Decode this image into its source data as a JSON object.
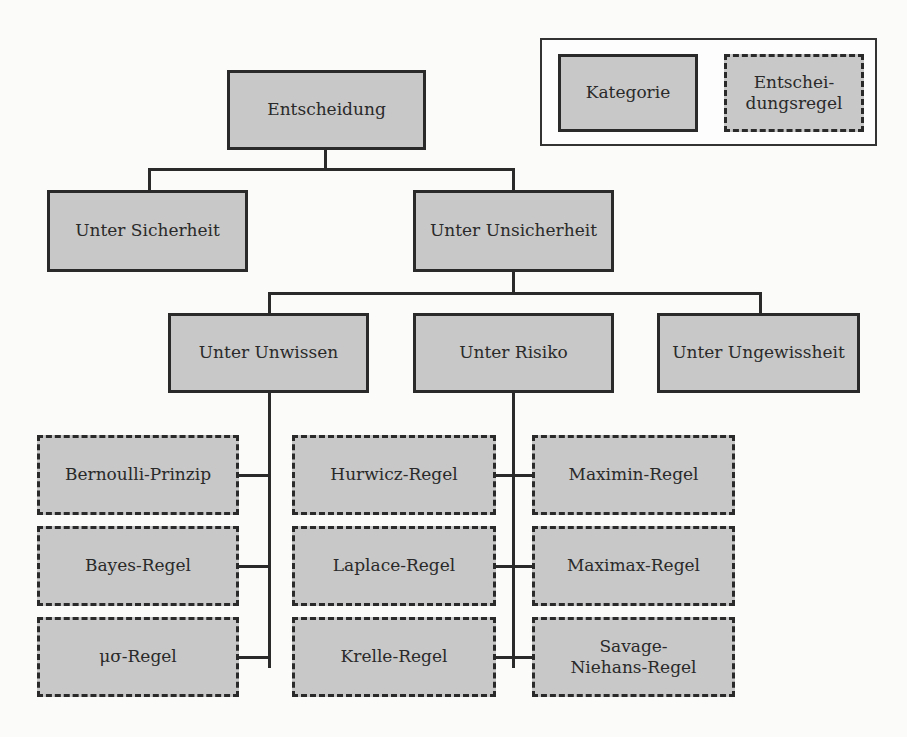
{
  "legend": {
    "category_label": "Kategorie",
    "rule_label_line1": "Entschei-",
    "rule_label_line2": "dungsregel"
  },
  "tree": {
    "root": "Entscheidung",
    "level1": [
      "Unter Sicherheit",
      "Unter Unsicherheit"
    ],
    "level2": [
      "Unter Unwissen",
      "Unter Risiko",
      "Unter Ungewissheit"
    ],
    "rules": {
      "col1": [
        "Bernoulli-Prinzip",
        "Bayes-Regel",
        "μσ-Regel"
      ],
      "col2": [
        "Hurwicz-Regel",
        "Laplace-Regel",
        "Krelle-Regel"
      ],
      "col3": [
        "Maximin-Regel",
        "Maximax-Regel",
        "Savage-Niehans-Regel"
      ]
    }
  },
  "colors": {
    "box_fill": "#c8c8c8",
    "line": "#2a2a2a",
    "background": "#fbfbfa"
  }
}
